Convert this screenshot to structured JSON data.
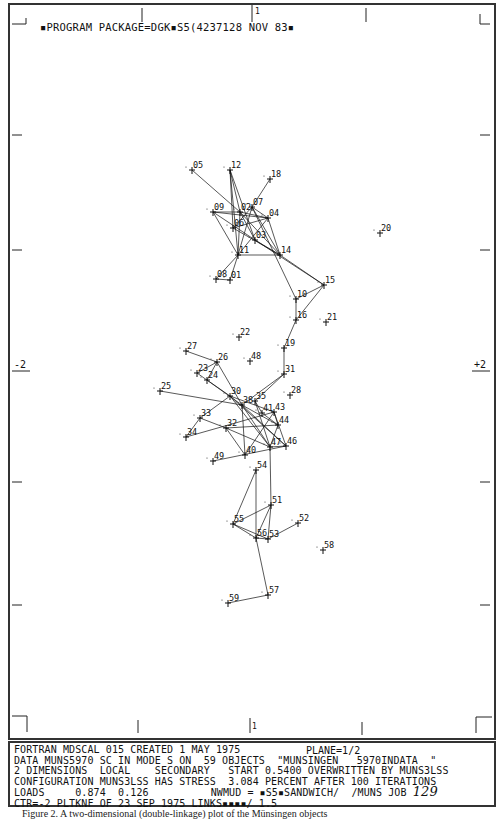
{
  "header": {
    "program_line": "▪PROGRAM PACKAGE=DGK▪S5(4237128 NOV 83▪",
    "top_axis_mark": "1"
  },
  "axes": {
    "left_label": "-2",
    "right_label": "+2",
    "top_label": "1",
    "bottom_label": "1"
  },
  "footer": {
    "line1": "FORTRAN MDSCAL 015 CREATED 1 MAY 1975",
    "plane": "PLANE=1/2",
    "line2": "DATA MUNS5970 SC IN MODE S ON  59 OBJECTS  \"MUNSINGEN   5970INDATA  \"",
    "line3": "2 DIMENSIONS  LOCAL    SECONDARY   START 0.5400 OVERWRITTEN BY MUNS3LSS",
    "line4": "CONFIGURATION MUNS3LSS HAS STRESS  3.084 PERCENT AFTER 100 ITERATIONS",
    "line5_left": "LOADS     0.874  0.126",
    "line5_right": "NWMUD = ▪S5▪SANDWICH/  /MUNS JOB ",
    "job_number": "129",
    "line6": "CTR=-2 PLTKNF OF 23 SEP 1975 LINKS▪▪▪▪/ 1.5"
  },
  "caption": "Figure 2.  A two-dimensional (double-linkage) plot of the Münsingen objects",
  "chart_data": {
    "type": "scatter",
    "xlabel": "Dimension 2",
    "ylabel": "Dimension 1",
    "xlim": [
      -2,
      2
    ],
    "ylim": [
      -1,
      1
    ],
    "points": [
      {
        "id": "05",
        "x": 192,
        "y": 170
      },
      {
        "id": "12",
        "x": 230,
        "y": 170
      },
      {
        "id": "18",
        "x": 270,
        "y": 179
      },
      {
        "id": "09",
        "x": 213,
        "y": 212
      },
      {
        "id": "07",
        "x": 252,
        "y": 207
      },
      {
        "id": "04",
        "x": 268,
        "y": 218
      },
      {
        "id": "02",
        "x": 240,
        "y": 212
      },
      {
        "id": "06",
        "x": 233,
        "y": 228
      },
      {
        "id": "03",
        "x": 255,
        "y": 240
      },
      {
        "id": "11",
        "x": 238,
        "y": 255
      },
      {
        "id": "14",
        "x": 280,
        "y": 255
      },
      {
        "id": "20",
        "x": 380,
        "y": 233
      },
      {
        "id": "08",
        "x": 216,
        "y": 279
      },
      {
        "id": "01",
        "x": 230,
        "y": 280
      },
      {
        "id": "15",
        "x": 324,
        "y": 285
      },
      {
        "id": "10",
        "x": 296,
        "y": 299
      },
      {
        "id": "16",
        "x": 296,
        "y": 320
      },
      {
        "id": "21",
        "x": 326,
        "y": 322
      },
      {
        "id": "22",
        "x": 239,
        "y": 337
      },
      {
        "id": "19",
        "x": 284,
        "y": 348
      },
      {
        "id": "27",
        "x": 186,
        "y": 351
      },
      {
        "id": "26",
        "x": 217,
        "y": 362
      },
      {
        "id": "48",
        "x": 250,
        "y": 361
      },
      {
        "id": "23",
        "x": 197,
        "y": 373
      },
      {
        "id": "24",
        "x": 207,
        "y": 380
      },
      {
        "id": "31",
        "x": 284,
        "y": 374
      },
      {
        "id": "25",
        "x": 160,
        "y": 391
      },
      {
        "id": "28",
        "x": 290,
        "y": 395
      },
      {
        "id": "30",
        "x": 230,
        "y": 396
      },
      {
        "id": "35",
        "x": 255,
        "y": 401
      },
      {
        "id": "38",
        "x": 242,
        "y": 405
      },
      {
        "id": "41",
        "x": 262,
        "y": 413
      },
      {
        "id": "43",
        "x": 274,
        "y": 412
      },
      {
        "id": "33",
        "x": 200,
        "y": 418
      },
      {
        "id": "32",
        "x": 226,
        "y": 428
      },
      {
        "id": "44",
        "x": 278,
        "y": 425
      },
      {
        "id": "34",
        "x": 186,
        "y": 437
      },
      {
        "id": "47",
        "x": 270,
        "y": 447
      },
      {
        "id": "46",
        "x": 286,
        "y": 446
      },
      {
        "id": "40",
        "x": 245,
        "y": 455
      },
      {
        "id": "49",
        "x": 213,
        "y": 461
      },
      {
        "id": "54",
        "x": 256,
        "y": 470
      },
      {
        "id": "51",
        "x": 271,
        "y": 505
      },
      {
        "id": "52",
        "x": 298,
        "y": 523
      },
      {
        "id": "55",
        "x": 233,
        "y": 524
      },
      {
        "id": "56",
        "x": 256,
        "y": 538
      },
      {
        "id": "53",
        "x": 268,
        "y": 539
      },
      {
        "id": "58",
        "x": 323,
        "y": 550
      },
      {
        "id": "57",
        "x": 268,
        "y": 595
      },
      {
        "id": "59",
        "x": 228,
        "y": 603
      }
    ],
    "links": [
      [
        "05",
        "02"
      ],
      [
        "12",
        "02"
      ],
      [
        "12",
        "06"
      ],
      [
        "12",
        "11"
      ],
      [
        "12",
        "03"
      ],
      [
        "18",
        "07"
      ],
      [
        "09",
        "02"
      ],
      [
        "09",
        "04"
      ],
      [
        "09",
        "11"
      ],
      [
        "09",
        "03"
      ],
      [
        "07",
        "04"
      ],
      [
        "07",
        "11"
      ],
      [
        "07",
        "14"
      ],
      [
        "02",
        "04"
      ],
      [
        "02",
        "11"
      ],
      [
        "02",
        "14"
      ],
      [
        "02",
        "03"
      ],
      [
        "06",
        "04"
      ],
      [
        "06",
        "14"
      ],
      [
        "06",
        "07"
      ],
      [
        "04",
        "11"
      ],
      [
        "04",
        "14"
      ],
      [
        "03",
        "14"
      ],
      [
        "11",
        "14"
      ],
      [
        "11",
        "08"
      ],
      [
        "11",
        "01"
      ],
      [
        "08",
        "01"
      ],
      [
        "14",
        "15"
      ],
      [
        "03",
        "15"
      ],
      [
        "07",
        "10"
      ],
      [
        "10",
        "15"
      ],
      [
        "10",
        "16"
      ],
      [
        "16",
        "15"
      ],
      [
        "16",
        "19"
      ],
      [
        "19",
        "31"
      ],
      [
        "31",
        "38"
      ],
      [
        "31",
        "35"
      ],
      [
        "27",
        "26"
      ],
      [
        "26",
        "23"
      ],
      [
        "26",
        "24"
      ],
      [
        "26",
        "38"
      ],
      [
        "23",
        "38"
      ],
      [
        "24",
        "30"
      ],
      [
        "25",
        "38"
      ],
      [
        "30",
        "46"
      ],
      [
        "30",
        "47"
      ],
      [
        "38",
        "47"
      ],
      [
        "38",
        "44"
      ],
      [
        "35",
        "41"
      ],
      [
        "41",
        "44"
      ],
      [
        "43",
        "44"
      ],
      [
        "43",
        "46"
      ],
      [
        "44",
        "47"
      ],
      [
        "33",
        "30"
      ],
      [
        "33",
        "32"
      ],
      [
        "32",
        "44"
      ],
      [
        "34",
        "43"
      ],
      [
        "34",
        "33"
      ],
      [
        "32",
        "47"
      ],
      [
        "40",
        "43"
      ],
      [
        "40",
        "38"
      ],
      [
        "49",
        "46"
      ],
      [
        "40",
        "32"
      ],
      [
        "47",
        "46"
      ],
      [
        "35",
        "47"
      ],
      [
        "30",
        "43"
      ],
      [
        "38",
        "46"
      ],
      [
        "54",
        "55"
      ],
      [
        "54",
        "56"
      ],
      [
        "51",
        "55"
      ],
      [
        "51",
        "56"
      ],
      [
        "51",
        "53"
      ],
      [
        "52",
        "53"
      ],
      [
        "55",
        "56"
      ],
      [
        "55",
        "53"
      ],
      [
        "56",
        "53"
      ],
      [
        "56",
        "57"
      ],
      [
        "57",
        "59"
      ],
      [
        "47",
        "51"
      ]
    ]
  }
}
